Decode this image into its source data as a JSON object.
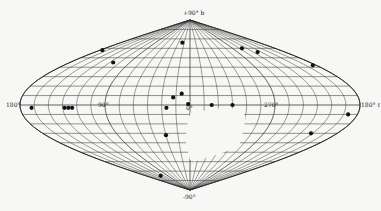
{
  "chart_data": {
    "type": "scatter",
    "title": "",
    "projection": "sinusoidal (equal-area) all-sky map, galactic coordinates",
    "xlabel": "l (galactic longitude)",
    "ylabel": "b (galactic latitude)",
    "axis_labels": {
      "north_pole": "+90° b",
      "south_pole": "-90°",
      "left_edge": "180°",
      "right_edge": "180° ℓ",
      "lon_90": "90°",
      "lon_0": "0°",
      "lon_270": "270°"
    },
    "xlim": [
      180,
      -180
    ],
    "ylim": [
      -90,
      90
    ],
    "grid": true,
    "grid_spacing_deg": {
      "longitude": 15,
      "latitude": 10
    },
    "unobserved_region": "blank area south of the equator between roughly l=0° and l=270°",
    "colors": {
      "grid": "#3a3a3a",
      "points": "#111111",
      "background": "#f7f7f5"
    },
    "series": [
      {
        "name": "sources",
        "points": [
          {
            "l": 20,
            "b": 66
          },
          {
            "l": -110,
            "b": 60
          },
          {
            "l": -128,
            "b": 56
          },
          {
            "l": -185,
            "b": 58
          },
          {
            "l": -175,
            "b": 42
          },
          {
            "l": -245,
            "b": 45
          },
          {
            "l": 9,
            "b": 12
          },
          {
            "l": 25,
            "b": -3
          },
          {
            "l": 168,
            "b": -3
          },
          {
            "l": 133,
            "b": -3
          },
          {
            "l": 129,
            "b": -3
          },
          {
            "l": 125,
            "b": -3
          },
          {
            "l": 2,
            "b": 1
          },
          {
            "l": -23,
            "b": 0
          },
          {
            "l": -45,
            "b": 0
          },
          {
            "l": 30,
            "b": -32
          },
          {
            "l": 212,
            "b": -30
          },
          {
            "l": 120,
            "b": -75
          },
          {
            "l": -170,
            "b": -10
          },
          {
            "l": 18,
            "b": 8
          }
        ]
      }
    ]
  }
}
